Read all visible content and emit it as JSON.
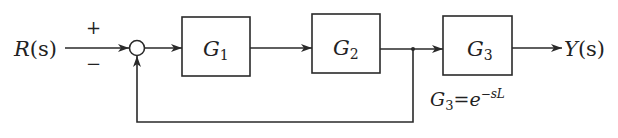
{
  "diagram": {
    "type": "block-diagram",
    "input": {
      "symbol": "R",
      "arg": "(s)"
    },
    "output": {
      "symbol": "Y",
      "arg": "(s)"
    },
    "summing_junction": {
      "plus_sign": "+",
      "minus_sign": "−"
    },
    "blocks": [
      {
        "id": "G1",
        "symbol": "G",
        "subscript": "1"
      },
      {
        "id": "G2",
        "symbol": "G",
        "subscript": "2"
      },
      {
        "id": "G3",
        "symbol": "G",
        "subscript": "3"
      }
    ],
    "annotation": {
      "lhs_symbol": "G",
      "lhs_subscript": "3",
      "equals": "=",
      "base": "e",
      "exponent": "−sL"
    },
    "feedback": "unity negative feedback taken from output of G2 to summing junction",
    "colors": {
      "line": "#2a2a2a",
      "background": "#ffffff"
    }
  }
}
